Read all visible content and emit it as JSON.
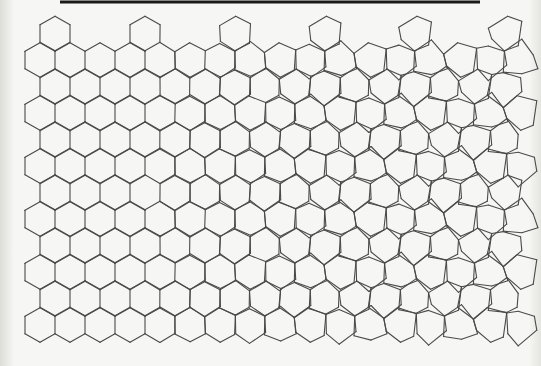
{
  "figure": {
    "title": "",
    "background_color": "#f6f6f4",
    "stroke_color": "#4a4a4a",
    "stroke_width": 1.1
  },
  "top_rule": {
    "x1": 60,
    "x2": 480,
    "y": 2,
    "thickness": 3,
    "color": "#1a1a1a"
  },
  "lattice": {
    "type": "honeycomb-pointy-top",
    "cell_width": 30,
    "row_pitch": 26.5,
    "origin_x": 25,
    "origin_y": 33.5,
    "rows": 13,
    "cols": 17,
    "morph_start_x": 140,
    "morph_end_x": 520,
    "top_row_cells_x": [
      55,
      145,
      235,
      325,
      415,
      500
    ],
    "bottom_limit_y": 350
  },
  "regions": {
    "left": "regular hexagons",
    "middle": "distorted hexagons / pentagons",
    "right": "large hexagons each divided into three pentagons by a Y-shaped junction"
  }
}
